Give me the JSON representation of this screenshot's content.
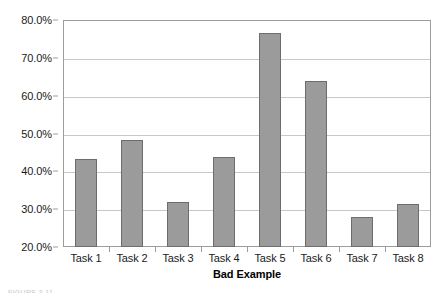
{
  "chart_data": {
    "type": "bar",
    "title": "",
    "xlabel": "Bad Example",
    "ylabel": "",
    "categories": [
      "Task 1",
      "Task 2",
      "Task 3",
      "Task 4",
      "Task 5",
      "Task 6",
      "Task 7",
      "Task 8"
    ],
    "values": [
      43.2,
      48.2,
      31.9,
      43.9,
      76.5,
      64.0,
      27.9,
      31.3
    ],
    "value_unit": "%",
    "ylim": [
      20.0,
      80.0
    ],
    "ytick_values": [
      20.0,
      30.0,
      40.0,
      50.0,
      60.0,
      70.0,
      80.0
    ],
    "ytick_labels": [
      "20.0%",
      "30.0%",
      "40.0%",
      "50.0%",
      "60.0%",
      "70.0%",
      "80.0%"
    ],
    "grid": true,
    "grid_axis": "y",
    "legend": false,
    "legend_position": "none",
    "series": [
      {
        "name": "Bad Example",
        "values": [
          43.2,
          48.2,
          31.9,
          43.9,
          76.5,
          64.0,
          27.9,
          31.3
        ]
      }
    ]
  },
  "style": {
    "bar_fill": "#9b9b9b",
    "bar_border": "#6d6d6d",
    "gridline_color": "#c8c8c8",
    "axis_color": "#9d9d9d",
    "plot_background": "#ffffff",
    "text_color": "#1a1a1a"
  },
  "caption": {
    "text": "FIGURE 3-11"
  }
}
